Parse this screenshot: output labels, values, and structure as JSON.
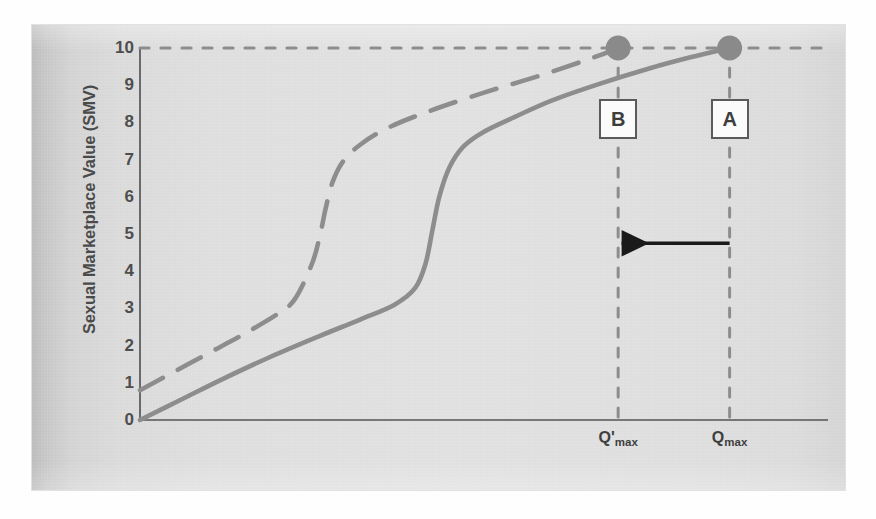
{
  "figure": {
    "panel_bg_left": "#bdbdbd",
    "panel_bg_right": "#d6d6d6",
    "curve_color": "#8d8d8d",
    "marker_color": "#8a8a8a",
    "axis_color": "#555555",
    "arrow_color": "#1a1a1a",
    "callout_border": "#5b5b5b"
  },
  "chart_data": {
    "type": "line",
    "title": "",
    "xlabel": "",
    "ylabel": "Sexual Marketplace Value (SMV)",
    "ylim": [
      0,
      10
    ],
    "yticks": [
      10,
      9,
      8,
      7,
      6,
      5,
      4,
      3,
      2,
      1,
      0
    ],
    "ytick_labels": [
      "10",
      "9",
      "8",
      "7",
      "6",
      "5",
      "4",
      "3",
      "2",
      "1",
      "0"
    ],
    "xlim": [
      0,
      1
    ],
    "xticks": [
      0.695,
      0.857
    ],
    "xtick_labels": [
      "Q'max",
      "Qmax"
    ],
    "grid": false,
    "legend": null,
    "series": [
      {
        "name": "shifted-curve",
        "style": "dashed",
        "color": "#8d8d8d",
        "comment": "leftward-shifted sigmoid reaching SMV 10 at Q'max",
        "x": [
          0.0,
          0.05,
          0.1,
          0.15,
          0.2,
          0.225,
          0.25,
          0.262,
          0.27,
          0.28,
          0.295,
          0.32,
          0.36,
          0.42,
          0.5,
          0.58,
          0.66,
          0.695
        ],
        "y": [
          0.8,
          1.3,
          1.8,
          2.3,
          2.85,
          3.25,
          4.2,
          5.0,
          5.7,
          6.4,
          6.95,
          7.4,
          7.85,
          8.3,
          8.8,
          9.25,
          9.75,
          10.0
        ]
      },
      {
        "name": "base-curve",
        "style": "solid",
        "color": "#8d8d8d",
        "comment": "original sigmoid reaching SMV 10 at Qmax",
        "x": [
          0.0,
          0.06,
          0.12,
          0.19,
          0.26,
          0.32,
          0.37,
          0.4,
          0.415,
          0.425,
          0.435,
          0.45,
          0.47,
          0.5,
          0.545,
          0.6,
          0.67,
          0.74,
          0.8,
          0.857
        ],
        "y": [
          0.0,
          0.55,
          1.1,
          1.7,
          2.25,
          2.7,
          3.1,
          3.55,
          4.2,
          5.1,
          6.0,
          6.8,
          7.35,
          7.75,
          8.15,
          8.6,
          9.05,
          9.45,
          9.75,
          10.0
        ]
      }
    ],
    "reference_lines": [
      {
        "name": "smv-max-line",
        "orientation": "horizontal",
        "value": 10,
        "style": "dashed",
        "color": "#8d8d8d"
      },
      {
        "name": "q-prime-max-line",
        "orientation": "vertical",
        "value": 0.695,
        "style": "dashed",
        "color": "#8d8d8d"
      },
      {
        "name": "q-max-line",
        "orientation": "vertical",
        "value": 0.857,
        "style": "dashed",
        "color": "#8d8d8d"
      }
    ],
    "markers": [
      {
        "name": "point-b",
        "x": 0.695,
        "y": 10,
        "label": "B",
        "color": "#8a8a8a"
      },
      {
        "name": "point-a",
        "x": 0.857,
        "y": 10,
        "label": "A",
        "color": "#8a8a8a"
      }
    ],
    "annotations": [
      {
        "name": "shift-arrow",
        "type": "arrow",
        "direction": "left",
        "from_x": 0.857,
        "to_x": 0.7,
        "y": 4.75,
        "color": "#1a1a1a"
      }
    ]
  },
  "callouts": {
    "b": "B",
    "a": "A"
  },
  "x_axis": {
    "tick_q_prime_max_base": "Q'",
    "tick_q_prime_max_sub": "max",
    "tick_q_max_base": "Q",
    "tick_q_max_sub": "max"
  }
}
